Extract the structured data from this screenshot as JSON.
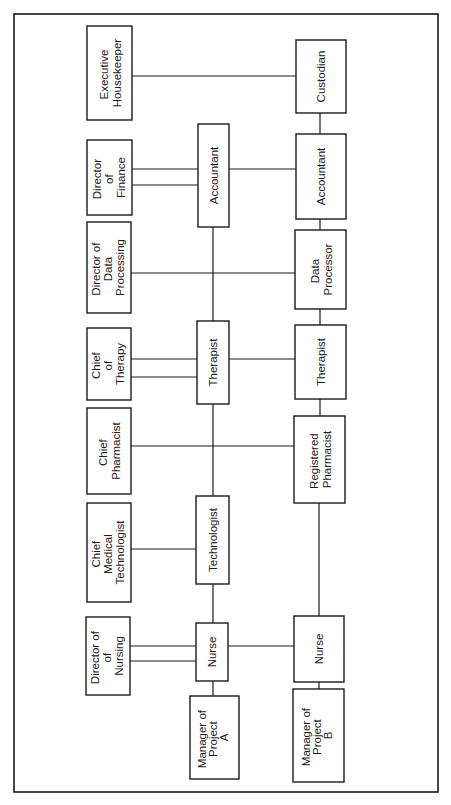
{
  "diagram": {
    "type": "organizational-chart",
    "orientation": "rotated-90-ccw",
    "colors": {
      "line": "#1a1a1a",
      "background": "#ffffff"
    },
    "department_heads": [
      {
        "id": "exec_housekeeper",
        "lines": [
          "Executive",
          "Housekeeper"
        ]
      },
      {
        "id": "dir_finance",
        "lines": [
          "Director",
          "of",
          "Finance"
        ]
      },
      {
        "id": "dir_data_processing",
        "lines": [
          "Director of",
          "Data",
          "Processing"
        ]
      },
      {
        "id": "chief_therapy",
        "lines": [
          "Chief",
          "of",
          "Therapy"
        ]
      },
      {
        "id": "chief_pharmacist",
        "lines": [
          "Chief",
          "Pharmacist"
        ]
      },
      {
        "id": "chief_med_tech",
        "lines": [
          "Chief",
          "Medical",
          "Technologist"
        ]
      },
      {
        "id": "dir_nursing",
        "lines": [
          "Director of",
          "of",
          "Nursing"
        ]
      }
    ],
    "project_a": {
      "manager": {
        "id": "mgr_a",
        "lines": [
          "Manager of",
          "Project",
          "A"
        ]
      },
      "staff": [
        {
          "id": "accountant_a",
          "lines": [
            "Accountant"
          ]
        },
        {
          "id": "therapist_a",
          "lines": [
            "Therapist"
          ]
        },
        {
          "id": "technologist_a",
          "lines": [
            "Technologist"
          ]
        },
        {
          "id": "nurse_a",
          "lines": [
            "Nurse"
          ]
        }
      ]
    },
    "project_b": {
      "manager": {
        "id": "mgr_b",
        "lines": [
          "Manager of",
          "Project",
          "B"
        ]
      },
      "staff": [
        {
          "id": "custodian_b",
          "lines": [
            "Custodian"
          ]
        },
        {
          "id": "accountant_b",
          "lines": [
            "Accountant"
          ]
        },
        {
          "id": "data_processor_b",
          "lines": [
            "Data",
            "Processor"
          ]
        },
        {
          "id": "therapist_b",
          "lines": [
            "Therapist"
          ]
        },
        {
          "id": "reg_pharmacist_b",
          "lines": [
            "Registered",
            "Pharmacist"
          ]
        },
        {
          "id": "nurse_b",
          "lines": [
            "Nurse"
          ]
        }
      ]
    },
    "connections": [
      {
        "from": "exec_housekeeper",
        "to": "custodian_b",
        "style": "single"
      },
      {
        "from": "dir_finance",
        "to": "accountant_a",
        "style": "double"
      },
      {
        "from": "accountant_a",
        "to": "accountant_b",
        "style": "single"
      },
      {
        "from": "dir_data_processing",
        "to": "data_processor_b",
        "style": "single"
      },
      {
        "from": "chief_therapy",
        "to": "therapist_a",
        "style": "double"
      },
      {
        "from": "therapist_a",
        "to": "therapist_b",
        "style": "single"
      },
      {
        "from": "chief_pharmacist",
        "to": "reg_pharmacist_b",
        "style": "single"
      },
      {
        "from": "chief_med_tech",
        "to": "technologist_a",
        "style": "single"
      },
      {
        "from": "dir_nursing",
        "to": "nurse_a",
        "style": "double"
      },
      {
        "from": "nurse_a",
        "to": "nurse_b",
        "style": "single"
      },
      {
        "from": "mgr_a",
        "to": "nurse_a",
        "style": "chain"
      },
      {
        "from": "mgr_b",
        "to": "nurse_b",
        "style": "chain"
      }
    ]
  }
}
